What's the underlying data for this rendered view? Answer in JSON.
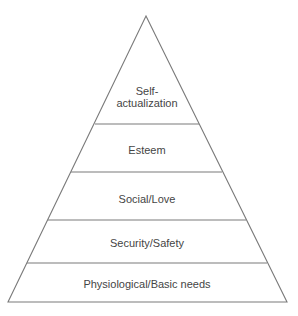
{
  "diagram": {
    "type": "pyramid",
    "apex": {
      "x": 146,
      "y": 16
    },
    "base": {
      "y": 302,
      "left_x": 8,
      "right_x": 287
    },
    "line_color": "#7a7a7a",
    "text_color": "#454545",
    "levels": [
      {
        "id": "self-actualization",
        "lines": [
          "Self-",
          "actualization"
        ],
        "top_y": 16,
        "bottom_y": 124
      },
      {
        "id": "esteem",
        "lines": [
          "Esteem"
        ],
        "top_y": 124,
        "bottom_y": 172
      },
      {
        "id": "social-love",
        "lines": [
          "Social/Love"
        ],
        "top_y": 172,
        "bottom_y": 220
      },
      {
        "id": "security-safety",
        "lines": [
          "Security/Safety"
        ],
        "top_y": 220,
        "bottom_y": 263
      },
      {
        "id": "physiological",
        "lines": [
          "Physiological/Basic needs"
        ],
        "top_y": 263,
        "bottom_y": 302
      }
    ]
  }
}
